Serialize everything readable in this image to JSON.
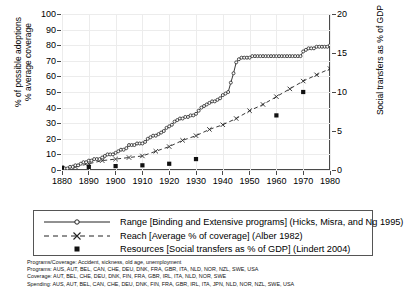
{
  "chart_data": {
    "type": "line",
    "title": "",
    "xlabel": "",
    "ylabel_left_line1": "% of possible adoptions",
    "ylabel_left_line2": "% average coverage",
    "ylabel_right": "Social transfers as % of GDP",
    "xlim": [
      1880,
      1980
    ],
    "ylim_left": [
      0,
      100
    ],
    "ylim_right": [
      0,
      20
    ],
    "xticks": [
      1880,
      1890,
      1900,
      1910,
      1920,
      1930,
      1940,
      1950,
      1960,
      1970,
      1980
    ],
    "yticks_left": [
      0,
      10,
      20,
      30,
      40,
      50,
      60,
      70,
      80,
      90,
      100
    ],
    "yticks_right": [
      0,
      5,
      10,
      15,
      20
    ],
    "grid": true,
    "legend_position": "below-plot",
    "series": [
      {
        "name": "Range [Binding and Extensive programs] (Hicks, Misra, and Ng 1995)",
        "axis": "left",
        "marker": "open-circle",
        "linestyle": "solid",
        "x": [
          1880,
          1881,
          1882,
          1883,
          1884,
          1885,
          1886,
          1887,
          1888,
          1889,
          1890,
          1891,
          1892,
          1893,
          1894,
          1895,
          1896,
          1897,
          1898,
          1899,
          1900,
          1901,
          1902,
          1903,
          1904,
          1905,
          1906,
          1907,
          1908,
          1909,
          1910,
          1911,
          1912,
          1913,
          1914,
          1915,
          1916,
          1917,
          1918,
          1919,
          1920,
          1921,
          1922,
          1923,
          1924,
          1925,
          1926,
          1927,
          1928,
          1929,
          1930,
          1931,
          1932,
          1933,
          1934,
          1935,
          1936,
          1937,
          1938,
          1939,
          1940,
          1941,
          1942,
          1943,
          1944,
          1945,
          1946,
          1947,
          1948,
          1949,
          1950,
          1951,
          1952,
          1953,
          1954,
          1955,
          1956,
          1957,
          1958,
          1959,
          1960,
          1961,
          1962,
          1963,
          1964,
          1965,
          1966,
          1967,
          1968,
          1969,
          1970,
          1971,
          1972,
          1973,
          1974,
          1975,
          1976,
          1977,
          1978,
          1979,
          1980
        ],
        "y": [
          1,
          1,
          1,
          2,
          2,
          3,
          3,
          4,
          5,
          5,
          6,
          6,
          7,
          7,
          7,
          8,
          9,
          10,
          10,
          10,
          11,
          12,
          13,
          13,
          14,
          16,
          16,
          16,
          17,
          17,
          17,
          18,
          20,
          21,
          22,
          22,
          23,
          24,
          25,
          27,
          28,
          29,
          31,
          32,
          33,
          33,
          34,
          34,
          35,
          35,
          36,
          38,
          40,
          41,
          42,
          43,
          44,
          44,
          45,
          46,
          48,
          49,
          50,
          56,
          62,
          69,
          71,
          72,
          72,
          72,
          72,
          73,
          73,
          73,
          73,
          73,
          73,
          73,
          73,
          73,
          73,
          73,
          73,
          73,
          73,
          73,
          73,
          73,
          73,
          73,
          76,
          77,
          78,
          78,
          78,
          79,
          79,
          79,
          79,
          79,
          80
        ]
      },
      {
        "name": "Reach [Average % of coverage] (Alber 1982)",
        "axis": "left",
        "marker": "x",
        "linestyle": "dashed",
        "x": [
          1880,
          1885,
          1890,
          1895,
          1900,
          1905,
          1910,
          1915,
          1920,
          1925,
          1930,
          1935,
          1940,
          1945,
          1950,
          1955,
          1960,
          1965,
          1970,
          1975,
          1980
        ],
        "y": [
          1,
          2,
          4,
          6,
          7,
          8,
          9,
          12,
          15,
          19,
          22,
          26,
          29,
          33,
          38,
          42,
          47,
          52,
          57,
          61,
          65
        ]
      },
      {
        "name": "Resources [Social transfers as % of GDP] (Lindert 2004)",
        "axis": "right",
        "marker": "filled-square",
        "linestyle": "none",
        "x": [
          1880,
          1890,
          1900,
          1910,
          1920,
          1930,
          1960,
          1970,
          1980
        ],
        "y": [
          0.3,
          0.4,
          0.5,
          0.6,
          0.8,
          1.4,
          7.0,
          10.0,
          20.3
        ]
      }
    ]
  },
  "legend": {
    "items": [
      {
        "key": "line-open-circle",
        "label": "Range [Binding and Extensive programs] (Hicks, Misra, and Ng 1995)"
      },
      {
        "key": "dashed-x",
        "label": "Reach [Average % of coverage] (Alber 1982)"
      },
      {
        "key": "filled-square",
        "label": "Resources [Social transfers as % of GDP] (Lindert 2004)"
      }
    ]
  },
  "footnotes": [
    "Programs/Coverage: Accident, sickness, old age, unemployment",
    "Programs: AUS, AUT, BEL, CAN, CHE, DEU, DNK, FRA, GBR, ITA, NLD, NOR, NZL, SWE, USA",
    "Coverage: AUT, BEL, CHE, DEU, DNK, FIN, FRA, GBR, IRL, ITA, NLD, NOR, SWE",
    "Spending: AUS, AUT, BEL, CAN, CHE, DEU, DNK, FIN, FRA, GBR, IRL, ITA, JPN, NLD, NOR, NZL, SWE, USA"
  ],
  "colors": {
    "line": "#222222",
    "frame": "#4a4a4a",
    "grid": "#ececec",
    "text": "#000000"
  }
}
